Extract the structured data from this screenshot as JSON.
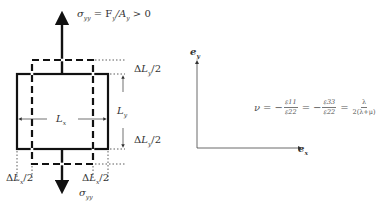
{
  "diagram": {
    "labels": {
      "stress_top": "σyy = Fy/Ay > 0",
      "stress_top_parts": {
        "sigma": "σ",
        "sigma_sub": "yy",
        "eq": " = F",
        "f_sub": "y",
        "slash": "/A",
        "a_sub": "y",
        "tail": " > 0"
      },
      "stress_bottom": {
        "sigma": "σ",
        "sub": "yy"
      },
      "delta_ly_top": {
        "main": "ΔL",
        "sub": "y",
        "tail": "/2"
      },
      "delta_ly_bottom": {
        "main": "ΔL",
        "sub": "y",
        "tail": "/2"
      },
      "ly": {
        "main": "L",
        "sub": "y"
      },
      "lx": {
        "main": "L",
        "sub": "x"
      },
      "delta_lx_left": {
        "main": "ΔL",
        "sub": "x",
        "tail": "/2"
      },
      "delta_lx_right": {
        "main": "ΔL",
        "sub": "x",
        "tail": "/2"
      },
      "axis_x": {
        "main": "e",
        "sub": "x"
      },
      "axis_y": {
        "main": "e",
        "sub": "y"
      }
    },
    "formula": {
      "lhs": "ν",
      "eq": "=",
      "minus": "−",
      "frac1": {
        "num": "ε11",
        "den": "ε22"
      },
      "frac2": {
        "num": "ε33",
        "den": "ε22"
      },
      "frac3": {
        "num": "λ",
        "den": "2(λ+μ)"
      }
    },
    "elements": [
      "original-specimen-solid",
      "deformed-specimen-dashed",
      "load-arrows",
      "dimension-lines",
      "coordinate-axes"
    ]
  }
}
